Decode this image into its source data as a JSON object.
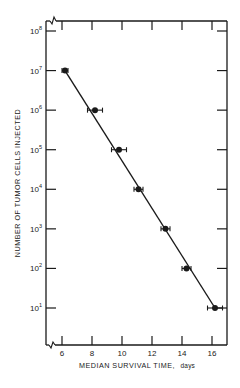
{
  "chart_data": {
    "type": "scatter",
    "title": "",
    "xlabel": "MEDIAN SURVIVAL TIME, days",
    "ylabel": "NUMBER OF TUMOR CELLS INJECTED",
    "xscale": "linear",
    "yscale": "log",
    "xlim": [
      5,
      17
    ],
    "ylim": [
      1,
      100000000
    ],
    "x_ticks": [
      6,
      8,
      10,
      12,
      14,
      16
    ],
    "x_tick_labels": [
      "6",
      "8",
      "10",
      "12",
      "14",
      "16"
    ],
    "y_ticks": [
      10,
      100,
      1000,
      10000,
      100000,
      1000000,
      10000000,
      100000000
    ],
    "y_tick_labels": [
      "10^1",
      "10^2",
      "10^3",
      "10^4",
      "10^5",
      "10^6",
      "10^7",
      "10^8"
    ],
    "axis_breaks": [
      "x-axis origin",
      "top-left corner"
    ],
    "grid": false,
    "legend": null,
    "series": [
      {
        "name": "Median survival",
        "marker": "filled-circle",
        "error_bars": "horizontal",
        "points": [
          {
            "x": 6.2,
            "y": 10000000,
            "xerr": 0.2
          },
          {
            "x": 8.2,
            "y": 1000000,
            "xerr": 0.5
          },
          {
            "x": 9.8,
            "y": 100000,
            "xerr": 0.5
          },
          {
            "x": 11.1,
            "y": 10000,
            "xerr": 0.3
          },
          {
            "x": 12.9,
            "y": 1000,
            "xerr": 0.3
          },
          {
            "x": 14.3,
            "y": 100,
            "xerr": 0.3
          },
          {
            "x": 16.2,
            "y": 10,
            "xerr": 0.5
          }
        ]
      }
    ],
    "fit_line": {
      "from": {
        "x": 6.2,
        "y": 10000000
      },
      "to": {
        "x": 16.2,
        "y": 10
      },
      "style": "solid"
    }
  },
  "labels": {
    "xlabel_main": "MEDIAN SURVIVAL TIME,",
    "xlabel_unit": "days",
    "ylabel": "NUMBER OF TUMOR CELLS INJECTED"
  }
}
